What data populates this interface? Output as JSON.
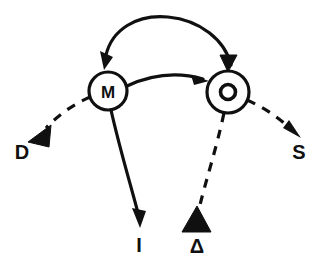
{
  "diagram": {
    "type": "node-link-diagram",
    "background_color": "#ffffff",
    "stroke_color": "#101010",
    "width": 320,
    "height": 269,
    "nodes": [
      {
        "id": "M",
        "label": "M",
        "shape": "circle",
        "cx": 108,
        "cy": 91,
        "r": 19,
        "inner_glyph": "none"
      },
      {
        "id": "O",
        "label": "O",
        "shape": "circle",
        "cx": 228,
        "cy": 92,
        "r": 21,
        "inner_glyph": "small-circle"
      }
    ],
    "endpoints": [
      {
        "id": "D",
        "label": "D",
        "x": 22,
        "y": 152,
        "arrowhead": "solid-triangle",
        "line_style": "dashed",
        "from": "M"
      },
      {
        "id": "I",
        "label": "I",
        "x": 139,
        "y": 245,
        "arrowhead": "open-thin",
        "line_style": "solid",
        "from": "M"
      },
      {
        "id": "delta",
        "label": "Δ",
        "x": 197,
        "y": 246,
        "arrowhead": "solid-triangle",
        "line_style": "dashed",
        "from": "O"
      },
      {
        "id": "S",
        "label": "S",
        "x": 299,
        "y": 152,
        "arrowhead": "open-thin",
        "line_style": "dashed",
        "from": "O"
      }
    ],
    "edges": [
      {
        "id": "arc-O-to-M",
        "from": "O",
        "to": "M",
        "style": "solid-arc-top",
        "arrowhead_at_target": "open-thin",
        "arrowhead_at_source": "solid-triangle"
      },
      {
        "id": "arrow-M-to-O",
        "from": "M",
        "to": "O",
        "style": "solid-curve",
        "arrowhead_at_target": "open-thin"
      }
    ]
  }
}
